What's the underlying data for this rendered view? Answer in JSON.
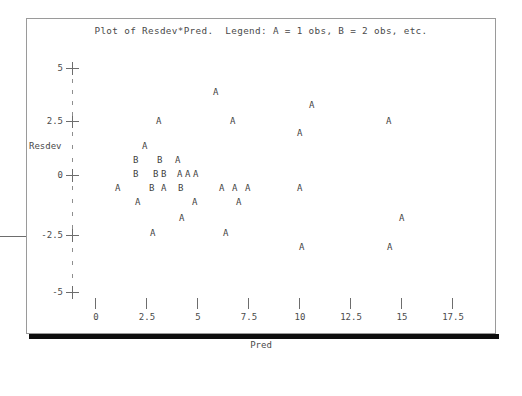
{
  "plot": {
    "title": "Plot of Resdev*Pred.  Legend: A = 1 obs, B = 2 obs, etc.",
    "x_axis_title": "Pred",
    "y_axis_title": "Resdev"
  },
  "axes": {
    "x_tick_labels": [
      "0",
      "2.5",
      "5",
      "7.5",
      "10",
      "12.5",
      "15",
      "17.5"
    ],
    "y_tick_labels": [
      "5",
      "2.5",
      "0",
      "-2.5",
      "-5"
    ]
  },
  "chart_data": {
    "type": "scatter",
    "title": "Plot of Resdev*Pred.  Legend: A = 1 obs, B = 2 obs, etc.",
    "xlabel": "Pred",
    "ylabel": "Resdev",
    "xlim": [
      0,
      17.5
    ],
    "ylim": [
      -5,
      5
    ],
    "xticks": [
      0,
      2.5,
      5,
      7.5,
      10,
      12.5,
      15,
      17.5
    ],
    "yticks": [
      5,
      2.5,
      0,
      -2.5,
      -5
    ],
    "grid": false,
    "legend": "A = 1 obs, B = 2 obs, etc.",
    "marker_encoding": {
      "A": 1,
      "B": 2
    },
    "points": [
      {
        "label": "A",
        "x": 6.0,
        "y": 3.9,
        "px": 216,
        "py": 92
      },
      {
        "label": "A",
        "x": 10.7,
        "y": 3.3,
        "px": 312,
        "py": 105
      },
      {
        "label": "A",
        "x": 3.2,
        "y": 2.5,
        "px": 159,
        "py": 121
      },
      {
        "label": "A",
        "x": 6.8,
        "y": 2.5,
        "px": 233,
        "py": 121
      },
      {
        "label": "A",
        "x": 14.5,
        "y": 2.5,
        "px": 389,
        "py": 121
      },
      {
        "label": "A",
        "x": 10.1,
        "y": 2.1,
        "px": 300,
        "py": 133
      },
      {
        "label": "A",
        "x": 2.5,
        "y": 1.5,
        "px": 145,
        "py": 146
      },
      {
        "label": "B",
        "x": 2.1,
        "y": 1.0,
        "px": 136,
        "py": 160
      },
      {
        "label": "B",
        "x": 3.3,
        "y": 1.0,
        "px": 160,
        "py": 160
      },
      {
        "label": "A",
        "x": 4.2,
        "y": 1.0,
        "px": 178,
        "py": 160
      },
      {
        "label": "B",
        "x": 2.1,
        "y": 0.0,
        "px": 136,
        "py": 174
      },
      {
        "label": "B",
        "x": 3.0,
        "y": 0.0,
        "px": 156,
        "py": 174
      },
      {
        "label": "B",
        "x": 3.4,
        "y": 0.0,
        "px": 164,
        "py": 174
      },
      {
        "label": "A",
        "x": 4.2,
        "y": 0.0,
        "px": 180,
        "py": 174
      },
      {
        "label": "A",
        "x": 4.5,
        "y": 0.0,
        "px": 188,
        "py": 174
      },
      {
        "label": "A",
        "x": 4.9,
        "y": 0.0,
        "px": 196,
        "py": 174
      },
      {
        "label": "A",
        "x": 1.2,
        "y": -0.6,
        "px": 118,
        "py": 188
      },
      {
        "label": "B",
        "x": 2.8,
        "y": -0.6,
        "px": 152,
        "py": 188
      },
      {
        "label": "A",
        "x": 3.4,
        "y": -0.6,
        "px": 164,
        "py": 188
      },
      {
        "label": "B",
        "x": 4.3,
        "y": -0.6,
        "px": 181,
        "py": 188
      },
      {
        "label": "A",
        "x": 6.3,
        "y": -0.6,
        "px": 222,
        "py": 188
      },
      {
        "label": "A",
        "x": 6.9,
        "y": -0.6,
        "px": 235,
        "py": 188
      },
      {
        "label": "A",
        "x": 7.5,
        "y": -0.6,
        "px": 248,
        "py": 188
      },
      {
        "label": "A",
        "x": 10.1,
        "y": -0.6,
        "px": 300,
        "py": 188
      },
      {
        "label": "A",
        "x": 2.2,
        "y": -1.2,
        "px": 138,
        "py": 202
      },
      {
        "label": "A",
        "x": 5.0,
        "y": -1.2,
        "px": 195,
        "py": 202
      },
      {
        "label": "A",
        "x": 7.1,
        "y": -1.2,
        "px": 239,
        "py": 202
      },
      {
        "label": "A",
        "x": 4.3,
        "y": -1.8,
        "px": 182,
        "py": 218
      },
      {
        "label": "A",
        "x": 15.1,
        "y": -1.8,
        "px": 402,
        "py": 218
      },
      {
        "label": "A",
        "x": 2.9,
        "y": -2.5,
        "px": 153,
        "py": 233
      },
      {
        "label": "A",
        "x": 6.5,
        "y": -2.5,
        "px": 226,
        "py": 233
      },
      {
        "label": "A",
        "x": 10.2,
        "y": -3.1,
        "px": 302,
        "py": 247
      },
      {
        "label": "A",
        "x": 14.6,
        "y": -3.1,
        "px": 390,
        "py": 247
      }
    ]
  }
}
